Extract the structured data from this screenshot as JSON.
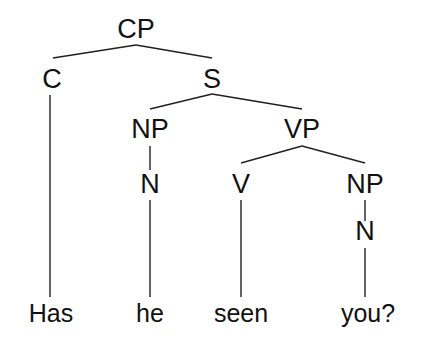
{
  "figure": {
    "kind": "syntax-tree-diagram",
    "sentence": "Has he seen you?",
    "background_color": "#ffffff",
    "line_color": "#231f20",
    "text_color": "#111111"
  },
  "nodes": {
    "cp": {
      "label": "CP",
      "x": 136,
      "y": 38
    },
    "c": {
      "label": "C",
      "x": 52,
      "y": 88
    },
    "s": {
      "label": "S",
      "x": 212,
      "y": 88
    },
    "np_subject": {
      "label": "NP",
      "x": 150,
      "y": 138
    },
    "vp": {
      "label": "VP",
      "x": 302,
      "y": 138
    },
    "n_subject": {
      "label": "N",
      "x": 150,
      "y": 193
    },
    "v": {
      "label": "V",
      "x": 241,
      "y": 193
    },
    "np_object": {
      "label": "NP",
      "x": 365,
      "y": 193
    },
    "n_object": {
      "label": "N",
      "x": 365,
      "y": 240
    }
  },
  "leaves": [
    {
      "label": "Has",
      "x": 51,
      "y": 322,
      "parent": "C"
    },
    {
      "label": "he",
      "x": 150,
      "y": 322,
      "parent": "N"
    },
    {
      "label": "seen",
      "x": 241,
      "y": 322,
      "parent": "V"
    },
    {
      "label": "you?",
      "x": 368,
      "y": 322,
      "parent": "N"
    }
  ],
  "edges": [
    {
      "name": "cp-to-c",
      "x1": 136,
      "y1": 45,
      "x2": 53,
      "y2": 58
    },
    {
      "name": "cp-to-s",
      "x1": 136,
      "y1": 45,
      "x2": 212,
      "y2": 58
    },
    {
      "name": "c-to-has",
      "x1": 50,
      "y1": 95,
      "x2": 50,
      "y2": 297
    },
    {
      "name": "s-to-np",
      "x1": 212,
      "y1": 94,
      "x2": 150,
      "y2": 109
    },
    {
      "name": "s-to-vp",
      "x1": 212,
      "y1": 94,
      "x2": 302,
      "y2": 109
    },
    {
      "name": "np-to-n",
      "x1": 150,
      "y1": 146,
      "x2": 150,
      "y2": 170
    },
    {
      "name": "vp-to-v",
      "x1": 302,
      "y1": 146,
      "x2": 241,
      "y2": 163
    },
    {
      "name": "vp-to-np",
      "x1": 302,
      "y1": 146,
      "x2": 365,
      "y2": 163
    },
    {
      "name": "n-to-he",
      "x1": 150,
      "y1": 200,
      "x2": 150,
      "y2": 297
    },
    {
      "name": "v-to-seen",
      "x1": 241,
      "y1": 200,
      "x2": 241,
      "y2": 297
    },
    {
      "name": "np-to-n-object",
      "x1": 365,
      "y1": 200,
      "x2": 365,
      "y2": 221
    },
    {
      "name": "n-to-you",
      "x1": 365,
      "y1": 248,
      "x2": 365,
      "y2": 297
    }
  ]
}
